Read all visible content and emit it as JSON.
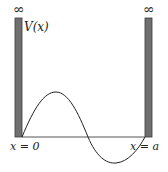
{
  "diagram": {
    "labels": {
      "potential": "V(x)",
      "left_infinity": "∞",
      "right_infinity": "∞",
      "left_boundary": "x = 0",
      "right_boundary": "x = a"
    },
    "colors": {
      "wall": "#6e6e6e",
      "wall_edge": "#3a3a3a",
      "curve": "#222222",
      "baseline": "#444444"
    },
    "geometry": {
      "left_wall": {
        "x": 15,
        "y": 18,
        "width": 7,
        "height": 119
      },
      "right_wall": {
        "x": 145,
        "y": 18,
        "width": 7,
        "height": 119
      },
      "baseline_y": 137,
      "curve": {
        "start_x": 22,
        "zero_cross_x": 88,
        "end_x": 145,
        "peak": [
          56,
          92
        ],
        "trough": [
          116,
          163
        ]
      }
    }
  }
}
